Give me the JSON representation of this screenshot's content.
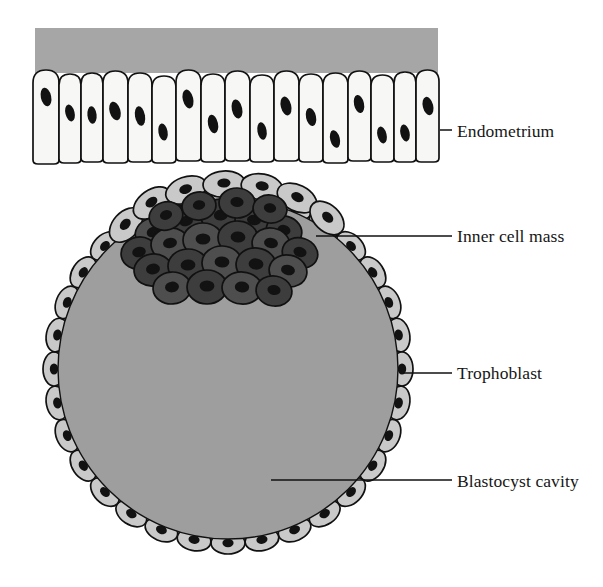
{
  "figure": {
    "width": 603,
    "height": 587,
    "background": "#ffffff"
  },
  "colors": {
    "endometrium_band": "#a6a6a6",
    "endometrium_cell_fill": "#f7f7f5",
    "blastocyst_cavity": "#9e9e9e",
    "trophoblast_cell_fill": "#c9c9c9",
    "inner_cell_mass_fill": "#4e4e4e",
    "inner_cell_mass_fill_dark": "#3d3d3d",
    "nucleus": "#121212",
    "outline": "#111111",
    "label_text": "#161616",
    "leader_line": "#111111"
  },
  "labels": [
    {
      "id": "endometrium",
      "text": "Endometrium",
      "text_x": 457,
      "text_y": 137,
      "leader": {
        "x1": 440,
        "y1": 130,
        "x2": 452,
        "y2": 130
      }
    },
    {
      "id": "inner-cell-mass",
      "text": "Inner cell mass",
      "text_x": 457,
      "text_y": 242,
      "leader": {
        "x1": 316,
        "y1": 236,
        "x2": 452,
        "y2": 236
      }
    },
    {
      "id": "trophoblast",
      "text": "Trophoblast",
      "text_x": 457,
      "text_y": 379,
      "leader": {
        "x1": 403,
        "y1": 373,
        "x2": 452,
        "y2": 373
      }
    },
    {
      "id": "blastocyst-cavity",
      "text": "Blastocyst cavity",
      "text_x": 457,
      "text_y": 487,
      "leader": {
        "x1": 271,
        "y1": 480,
        "x2": 452,
        "y2": 480
      }
    }
  ],
  "endometrium": {
    "band": {
      "x": 35,
      "y": 28,
      "width": 403,
      "height": 45
    },
    "cell_count": 17,
    "cell_row": {
      "x_start": 32,
      "x_end": 438,
      "y_top": 70,
      "y_bottom": 163
    },
    "cells": [
      {
        "x": 33,
        "w": 26,
        "top": 70,
        "bottom": 164,
        "nx": 46,
        "ny": 97,
        "nrx": 5.2,
        "nry": 9.5,
        "rot": -12
      },
      {
        "x": 59,
        "w": 22,
        "top": 74,
        "bottom": 163,
        "nx": 70,
        "ny": 113,
        "nrx": 4.6,
        "nry": 8.6,
        "rot": -14
      },
      {
        "x": 81,
        "w": 22,
        "top": 73,
        "bottom": 162,
        "nx": 92,
        "ny": 115,
        "nrx": 4.6,
        "nry": 8.8,
        "rot": -6
      },
      {
        "x": 103,
        "w": 25,
        "top": 71,
        "bottom": 163,
        "nx": 115,
        "ny": 111,
        "nrx": 5.4,
        "nry": 9.6,
        "rot": -16
      },
      {
        "x": 128,
        "w": 24,
        "top": 73,
        "bottom": 162,
        "nx": 140,
        "ny": 116,
        "nrx": 5.0,
        "nry": 9.8,
        "rot": -10
      },
      {
        "x": 152,
        "w": 24,
        "top": 76,
        "bottom": 163,
        "nx": 163,
        "ny": 132,
        "nrx": 4.6,
        "nry": 8.6,
        "rot": -10
      },
      {
        "x": 176,
        "w": 25,
        "top": 70,
        "bottom": 161,
        "nx": 188,
        "ny": 99,
        "nrx": 5.2,
        "nry": 9.6,
        "rot": -14
      },
      {
        "x": 201,
        "w": 24,
        "top": 74,
        "bottom": 162,
        "nx": 213,
        "ny": 124,
        "nrx": 5.0,
        "nry": 9.4,
        "rot": -12
      },
      {
        "x": 225,
        "w": 25,
        "top": 71,
        "bottom": 161,
        "nx": 237,
        "ny": 109,
        "nrx": 5.2,
        "nry": 9.6,
        "rot": -12
      },
      {
        "x": 250,
        "w": 24,
        "top": 75,
        "bottom": 162,
        "nx": 262,
        "ny": 131,
        "nrx": 4.6,
        "nry": 8.8,
        "rot": -10
      },
      {
        "x": 274,
        "w": 25,
        "top": 71,
        "bottom": 161,
        "nx": 286,
        "ny": 106,
        "nrx": 5.2,
        "nry": 9.6,
        "rot": -14
      },
      {
        "x": 299,
        "w": 24,
        "top": 74,
        "bottom": 162,
        "nx": 311,
        "ny": 117,
        "nrx": 5.0,
        "nry": 9.2,
        "rot": -12
      },
      {
        "x": 323,
        "w": 25,
        "top": 73,
        "bottom": 163,
        "nx": 335,
        "ny": 139,
        "nrx": 4.8,
        "nry": 9.0,
        "rot": -14
      },
      {
        "x": 348,
        "w": 23,
        "top": 71,
        "bottom": 161,
        "nx": 359,
        "ny": 104,
        "nrx": 5.0,
        "nry": 9.2,
        "rot": -12
      },
      {
        "x": 371,
        "w": 23,
        "top": 75,
        "bottom": 162,
        "nx": 382,
        "ny": 135,
        "nrx": 4.6,
        "nry": 8.6,
        "rot": -14
      },
      {
        "x": 394,
        "w": 22,
        "top": 72,
        "bottom": 162,
        "nx": 405,
        "ny": 133,
        "nrx": 4.6,
        "nry": 8.6,
        "rot": -12
      },
      {
        "x": 416,
        "w": 23,
        "top": 70,
        "bottom": 162,
        "nx": 428,
        "ny": 106,
        "nrx": 5.2,
        "nry": 9.4,
        "rot": -14
      }
    ]
  },
  "blastocyst": {
    "center_x": 228,
    "center_y": 369,
    "radius_outer": 184,
    "radius_cavity": 170,
    "trophoblast_cell_count": 32,
    "trophoblast_cells": [
      {
        "angle": -90,
        "rx": 17,
        "ry": 11
      },
      {
        "angle": -78.75,
        "rx": 17,
        "ry": 11
      },
      {
        "angle": -67.5,
        "rx": 17,
        "ry": 11
      },
      {
        "angle": -56.25,
        "rx": 17,
        "ry": 11
      },
      {
        "angle": -45,
        "rx": 17,
        "ry": 11
      },
      {
        "angle": -33.75,
        "rx": 17,
        "ry": 11
      },
      {
        "angle": -22.5,
        "rx": 17,
        "ry": 11
      },
      {
        "angle": -11.25,
        "rx": 17,
        "ry": 11
      },
      {
        "angle": 0,
        "rx": 17,
        "ry": 11
      },
      {
        "angle": 11.25,
        "rx": 17,
        "ry": 11
      },
      {
        "angle": 22.5,
        "rx": 17,
        "ry": 11
      },
      {
        "angle": 33.75,
        "rx": 17,
        "ry": 11
      },
      {
        "angle": 45,
        "rx": 17,
        "ry": 11
      },
      {
        "angle": 56.25,
        "rx": 17,
        "ry": 11
      },
      {
        "angle": 67.5,
        "rx": 17,
        "ry": 11
      },
      {
        "angle": 78.75,
        "rx": 17,
        "ry": 11
      },
      {
        "angle": 90,
        "rx": 17,
        "ry": 11
      },
      {
        "angle": 101.25,
        "rx": 17,
        "ry": 11
      },
      {
        "angle": 112.5,
        "rx": 17,
        "ry": 11
      },
      {
        "angle": 123.75,
        "rx": 17,
        "ry": 11
      },
      {
        "angle": 135,
        "rx": 17,
        "ry": 11
      },
      {
        "angle": 146.25,
        "rx": 17,
        "ry": 11
      },
      {
        "angle": 157.5,
        "rx": 17,
        "ry": 11
      },
      {
        "angle": 168.75,
        "rx": 17,
        "ry": 11
      },
      {
        "angle": 180,
        "rx": 17,
        "ry": 11
      },
      {
        "angle": 191.25,
        "rx": 17,
        "ry": 11
      },
      {
        "angle": 202.5,
        "rx": 17,
        "ry": 11
      },
      {
        "angle": 213.75,
        "rx": 17,
        "ry": 11
      },
      {
        "angle": 225,
        "rx": 17,
        "ry": 11
      },
      {
        "angle": 236.25,
        "rx": 17,
        "ry": 11
      },
      {
        "angle": 247.5,
        "rx": 17,
        "ry": 11
      },
      {
        "angle": 258.75,
        "rx": 17,
        "ry": 11
      }
    ],
    "inner_cell_mass": {
      "cell_count": 24,
      "cells": [
        {
          "cx": 153,
          "cy": 233,
          "rx": 18,
          "ry": 15,
          "rot": -18,
          "shade": "light",
          "nx": 153,
          "ny": 232,
          "nrx": 6.5,
          "nry": 5.0,
          "nrot": -20
        },
        {
          "cx": 186,
          "cy": 222,
          "rx": 19,
          "ry": 16,
          "rot": -10,
          "shade": "dark",
          "nx": 186,
          "ny": 221,
          "nrx": 7.0,
          "nry": 5.2,
          "nrot": -12
        },
        {
          "cx": 221,
          "cy": 216,
          "rx": 20,
          "ry": 17,
          "rot": -4,
          "shade": "dark",
          "nx": 221,
          "ny": 215,
          "nrx": 7.2,
          "nry": 5.5,
          "nrot": -6
        },
        {
          "cx": 254,
          "cy": 221,
          "rx": 19,
          "ry": 16,
          "rot": 8,
          "shade": "dark",
          "nx": 254,
          "ny": 220,
          "nrx": 7.0,
          "nry": 5.2,
          "nrot": 8
        },
        {
          "cx": 284,
          "cy": 231,
          "rx": 18,
          "ry": 15,
          "rot": 16,
          "shade": "dark",
          "nx": 284,
          "ny": 230,
          "nrx": 6.6,
          "nry": 5.0,
          "nrot": 16
        },
        {
          "cx": 139,
          "cy": 253,
          "rx": 18,
          "ry": 16,
          "rot": -12,
          "shade": "dark",
          "nx": 139,
          "ny": 252,
          "nrx": 6.8,
          "nry": 5.2,
          "nrot": -14
        },
        {
          "cx": 170,
          "cy": 244,
          "rx": 19,
          "ry": 16,
          "rot": -8,
          "shade": "light",
          "nx": 170,
          "ny": 243,
          "nrx": 7.0,
          "nry": 5.2,
          "nrot": -10
        },
        {
          "cx": 203,
          "cy": 240,
          "rx": 20,
          "ry": 17,
          "rot": 0,
          "shade": "light",
          "nx": 203,
          "ny": 239,
          "nrx": 7.4,
          "nry": 5.6,
          "nrot": 0
        },
        {
          "cx": 238,
          "cy": 238,
          "rx": 20,
          "ry": 17,
          "rot": 4,
          "shade": "dark",
          "nx": 238,
          "ny": 237,
          "nrx": 7.4,
          "nry": 5.6,
          "nrot": 4
        },
        {
          "cx": 271,
          "cy": 244,
          "rx": 19,
          "ry": 16,
          "rot": 10,
          "shade": "light",
          "nx": 271,
          "ny": 243,
          "nrx": 7.0,
          "nry": 5.2,
          "nrot": 10
        },
        {
          "cx": 300,
          "cy": 253,
          "rx": 18,
          "ry": 15,
          "rot": 18,
          "shade": "dark",
          "nx": 300,
          "ny": 252,
          "nrx": 6.6,
          "nry": 5.0,
          "nrot": 18
        },
        {
          "cx": 153,
          "cy": 270,
          "rx": 19,
          "ry": 16,
          "rot": -8,
          "shade": "dark",
          "nx": 153,
          "ny": 269,
          "nrx": 7.0,
          "nry": 5.4,
          "nrot": -10
        },
        {
          "cx": 188,
          "cy": 266,
          "rx": 20,
          "ry": 17,
          "rot": -2,
          "shade": "dark",
          "nx": 188,
          "ny": 265,
          "nrx": 7.4,
          "nry": 5.6,
          "nrot": -4
        },
        {
          "cx": 222,
          "cy": 263,
          "rx": 20,
          "ry": 17,
          "rot": 2,
          "shade": "light",
          "nx": 222,
          "ny": 262,
          "nrx": 7.4,
          "nry": 5.6,
          "nrot": 2
        },
        {
          "cx": 256,
          "cy": 265,
          "rx": 20,
          "ry": 17,
          "rot": 6,
          "shade": "dark",
          "nx": 256,
          "ny": 264,
          "nrx": 7.4,
          "nry": 5.6,
          "nrot": 6
        },
        {
          "cx": 288,
          "cy": 271,
          "rx": 19,
          "ry": 16,
          "rot": 12,
          "shade": "light",
          "nx": 288,
          "ny": 270,
          "nrx": 7.0,
          "nry": 5.2,
          "nrot": 12
        },
        {
          "cx": 172,
          "cy": 288,
          "rx": 19,
          "ry": 16,
          "rot": -4,
          "shade": "light",
          "nx": 172,
          "ny": 287,
          "nrx": 7.0,
          "nry": 5.4,
          "nrot": -6
        },
        {
          "cx": 207,
          "cy": 287,
          "rx": 20,
          "ry": 17,
          "rot": 0,
          "shade": "dark",
          "nx": 207,
          "ny": 286,
          "nrx": 7.4,
          "nry": 5.6,
          "nrot": 0
        },
        {
          "cx": 242,
          "cy": 288,
          "rx": 20,
          "ry": 16,
          "rot": 4,
          "shade": "light",
          "nx": 242,
          "ny": 287,
          "nrx": 7.2,
          "nry": 5.4,
          "nrot": 4
        },
        {
          "cx": 274,
          "cy": 291,
          "rx": 18,
          "ry": 15,
          "rot": 10,
          "shade": "dark",
          "nx": 274,
          "ny": 290,
          "nrx": 6.6,
          "nry": 5.0,
          "nrot": 10
        },
        {
          "cx": 166,
          "cy": 216,
          "rx": 17,
          "ry": 14,
          "rot": -16,
          "shade": "dark",
          "nx": 166,
          "ny": 215,
          "nrx": 6.2,
          "nry": 4.8,
          "nrot": -18
        },
        {
          "cx": 199,
          "cy": 206,
          "rx": 17,
          "ry": 14,
          "rot": -8,
          "shade": "dark",
          "nx": 199,
          "ny": 205,
          "nrx": 6.2,
          "nry": 4.8,
          "nrot": -10
        },
        {
          "cx": 237,
          "cy": 203,
          "rx": 18,
          "ry": 15,
          "rot": 2,
          "shade": "dark",
          "nx": 237,
          "ny": 202,
          "nrx": 6.6,
          "nry": 5.0,
          "nrot": 2
        },
        {
          "cx": 270,
          "cy": 209,
          "rx": 17,
          "ry": 14,
          "rot": 10,
          "shade": "dark",
          "nx": 270,
          "ny": 208,
          "nrx": 6.2,
          "nry": 4.8,
          "nrot": 10
        }
      ]
    },
    "icm_cap_cells": {
      "cell_count": 7,
      "cells": [
        {
          "cx": 126,
          "cy": 225,
          "rx": 20,
          "ry": 13,
          "rot": -48,
          "nx": 126,
          "ny": 224,
          "nrx": 6.4,
          "nry": 4.6,
          "nrot": -48
        },
        {
          "cx": 152,
          "cy": 203,
          "rx": 21,
          "ry": 13,
          "rot": -36,
          "nx": 152,
          "ny": 202,
          "nrx": 6.6,
          "nry": 4.6,
          "nrot": -36
        },
        {
          "cx": 186,
          "cy": 190,
          "rx": 21,
          "ry": 13,
          "rot": -20,
          "nx": 186,
          "ny": 189,
          "nrx": 6.6,
          "nry": 4.6,
          "nrot": -20
        },
        {
          "cx": 224,
          "cy": 184,
          "rx": 21,
          "ry": 13,
          "rot": -4,
          "nx": 224,
          "ny": 183,
          "nrx": 6.6,
          "nry": 4.6,
          "nrot": -4
        },
        {
          "cx": 262,
          "cy": 187,
          "rx": 21,
          "ry": 13,
          "rot": 10,
          "nx": 262,
          "ny": 186,
          "nrx": 6.6,
          "nry": 4.6,
          "nrot": 10
        },
        {
          "cx": 297,
          "cy": 198,
          "rx": 21,
          "ry": 13,
          "rot": 26,
          "nx": 297,
          "ny": 197,
          "nrx": 6.6,
          "nry": 4.6,
          "nrot": 26
        },
        {
          "cx": 327,
          "cy": 218,
          "rx": 20,
          "ry": 13,
          "rot": 44,
          "nx": 327,
          "ny": 217,
          "nrx": 6.4,
          "nry": 4.6,
          "nrot": 44
        }
      ]
    }
  }
}
